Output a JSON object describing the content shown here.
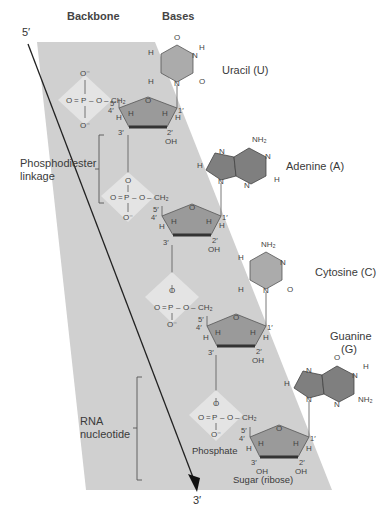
{
  "headers": {
    "backbone": "Backbone",
    "bases": "Bases"
  },
  "strand_ends": {
    "five_prime": "5′",
    "three_prime": "3′"
  },
  "side_labels": {
    "phosphodiester_line1": "Phosphodiester",
    "phosphodiester_line2": "linkage",
    "rna_line1": "RNA",
    "rna_line2": "nucleotide"
  },
  "part_labels": {
    "phosphate": "Phosphate",
    "sugar": "Sugar (ribose)"
  },
  "bases": [
    {
      "name": "Uracil (U)"
    },
    {
      "name": "Adenine (A)"
    },
    {
      "name": "Cytosine (C)"
    },
    {
      "name_line1": "Guanine",
      "name_line2": "(G)"
    }
  ],
  "atoms": {
    "O": "O",
    "P": "P",
    "N": "N",
    "H": "H",
    "OH": "OH",
    "O_minus": "O⁻",
    "CH2": "CH₂",
    "NH2": "NH₂",
    "c1": "1′",
    "c2": "2′",
    "c3": "3′",
    "c4": "4′",
    "c5": "5′"
  },
  "colors": {
    "band": "#cfcfcf",
    "sugar_fill": "#9a9a9a",
    "base_fill": "#a8a8a8",
    "purine_fill": "#7f7f7f",
    "phosphate_diamond": "#e2e2e2",
    "bond": "#555555"
  }
}
